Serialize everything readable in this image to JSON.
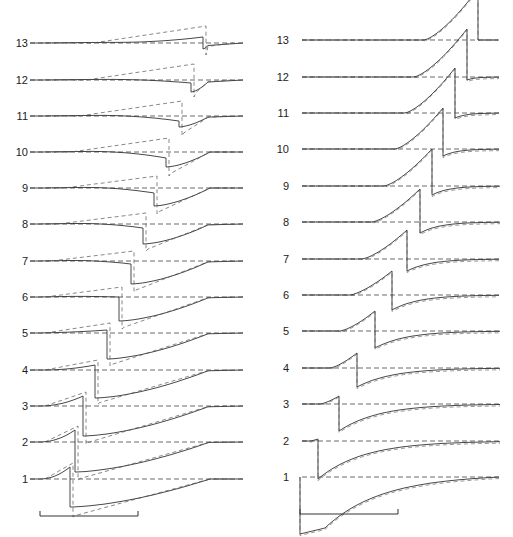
{
  "figure": {
    "width": 513,
    "height": 537,
    "colors": {
      "solid": "#333333",
      "dashed": "#555555",
      "baseline": "#444444",
      "text": "#222222"
    }
  },
  "chart_data": [
    {
      "type": "line",
      "panel": "left",
      "title": "",
      "xlabel": "",
      "ylabel": "",
      "grid": false,
      "legend": "none",
      "trace_labels": [
        "1",
        "2",
        "3",
        "4",
        "5",
        "6",
        "7",
        "8",
        "9",
        "10",
        "11",
        "12",
        "13"
      ],
      "baseline_y": [
        479,
        442,
        406,
        370,
        333,
        297,
        261,
        224,
        188,
        152,
        116,
        80,
        43
      ],
      "label_x": 34,
      "x_start": 30,
      "x_end": 243,
      "step_x": [
        70,
        75,
        83,
        95,
        107,
        119,
        131,
        143,
        154,
        166,
        179,
        191,
        203
      ],
      "pre_peak_solid": [
        12,
        12,
        10,
        5,
        3,
        0,
        -3,
        -4,
        -5,
        -6,
        -5,
        -3,
        6
      ],
      "pre_peak_dashed": [
        16,
        16,
        14,
        10,
        10,
        10,
        10,
        11,
        12,
        14,
        15,
        16,
        17
      ],
      "post_trough_solid": [
        -28,
        -30,
        -30,
        -28,
        -26,
        -24,
        -23,
        -20,
        -18,
        -15,
        -11,
        -12,
        -6
      ],
      "post_trough_dashed": [
        -38,
        -38,
        -38,
        -34,
        -33,
        -32,
        -31,
        -27,
        -26,
        -24,
        -20,
        -17,
        -12
      ],
      "recovery_x": 210,
      "scale_bar": {
        "x1": 40,
        "x2": 138,
        "y": 516,
        "tick_height": 5
      },
      "description": "Solid traces with dashed model overlays; each trace rises slightly then steps down sharply and recovers to baseline. Step position shifts right with increasing trace number."
    },
    {
      "type": "line",
      "panel": "right",
      "title": "",
      "xlabel": "",
      "ylabel": "",
      "grid": false,
      "legend": "none",
      "trace_labels": [
        "1",
        "2",
        "3",
        "4",
        "5",
        "6",
        "7",
        "8",
        "9",
        "10",
        "11",
        "12",
        "13"
      ],
      "baseline_y": [
        477,
        441,
        404,
        368,
        331,
        295,
        259,
        222,
        186,
        149,
        113,
        77,
        40
      ],
      "label_x": 289,
      "x_start": 302,
      "x_end": 500,
      "step_x": [
        300,
        318,
        339,
        357,
        375,
        392,
        407,
        420,
        432,
        443,
        455,
        467,
        478
      ],
      "pre_peak_solid": [
        0,
        2,
        8,
        15,
        20,
        24,
        29,
        33,
        37,
        41,
        45,
        48,
        51
      ],
      "post_trough_solid": [
        -57,
        -38,
        -27,
        -19,
        -17,
        -15,
        -12,
        -11,
        -9,
        -7,
        -5,
        -3,
        0
      ],
      "rise_start_x": [
        300,
        310,
        320,
        330,
        340,
        350,
        362,
        372,
        384,
        395,
        405,
        414,
        424
      ],
      "scale_bar": {
        "x1": 300,
        "x2": 398,
        "y": 514,
        "tick_height": 5
      },
      "description": "Solid traces closely overlaid by dashed traces; each rises progressively higher then drops sharply below baseline and recovers. Peak amplitude increases with trace number."
    }
  ]
}
